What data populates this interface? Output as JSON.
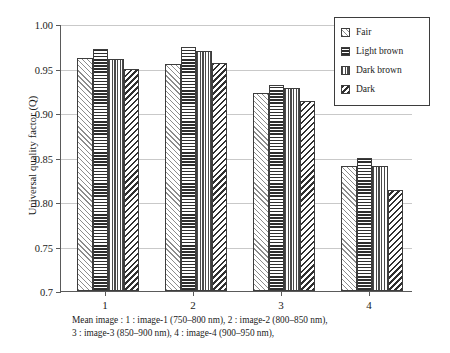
{
  "chart_data": {
    "type": "bar",
    "title": "",
    "xlabel": "",
    "ylabel": "Universal quality factor (Q)",
    "categories": [
      "1",
      "2",
      "3",
      "4"
    ],
    "ylim": [
      0.7,
      1.0
    ],
    "yticks": [
      "0.7",
      "0.75",
      "0.80",
      "0.85",
      "0.90",
      "0.95",
      "1.00"
    ],
    "ytick_values": [
      0.7,
      0.75,
      0.8,
      0.85,
      0.9,
      0.95,
      1.0
    ],
    "grid": true,
    "legend_position": "top-right",
    "series": [
      {
        "name": "Fair",
        "pattern": "diagonal-forward-light",
        "values": [
          0.962,
          0.955,
          0.923,
          0.841
        ]
      },
      {
        "name": "Light brown",
        "pattern": "horizontal-lines",
        "values": [
          0.972,
          0.974,
          0.932,
          0.85
        ]
      },
      {
        "name": "Dark brown",
        "pattern": "vertical-lines",
        "values": [
          0.961,
          0.97,
          0.928,
          0.841
        ]
      },
      {
        "name": "Dark",
        "pattern": "diagonal-back-dense",
        "values": [
          0.949,
          0.956,
          0.914,
          0.813
        ]
      }
    ],
    "caption_lines": [
      "Mean image : 1 : image-1 (750–800 nm), 2 : image-2 (800–850 nm),",
      "3 : image-3 (850–900 nm), 4 : image-4 (900–950 nm),"
    ]
  },
  "axes": {
    "y_title": "Universal quality factor (Q)"
  }
}
